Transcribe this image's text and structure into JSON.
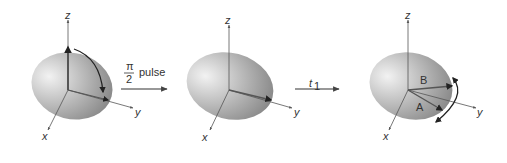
{
  "diagram": {
    "type": "spin-magnetization-sequence",
    "colors": {
      "ellipse_light": "#e6e6e6",
      "ellipse_dark": "#8a8a8a",
      "axis": "#555555",
      "vector": "#4a4a4a",
      "text": "#333333"
    },
    "panels": [
      {
        "id": "panel-1",
        "axes": {
          "z": "z",
          "y": "y",
          "x": "x"
        },
        "description": "Magnetization along z rotated toward y by curved arrow"
      },
      {
        "id": "panel-2",
        "axes": {
          "z": "z",
          "y": "y",
          "x": "x"
        },
        "description": "Magnetization along y"
      },
      {
        "id": "panel-3",
        "axes": {
          "z": "z",
          "y": "y",
          "x": "x"
        },
        "vectors": [
          {
            "label": "B"
          },
          {
            "label": "A"
          }
        ],
        "description": "Two magnetization components dephasing, double curved arrow"
      }
    ],
    "transitions": [
      {
        "numerator": "π",
        "denominator": "2",
        "text": "pulse"
      },
      {
        "symbol": "t",
        "subscript": "1"
      }
    ]
  }
}
